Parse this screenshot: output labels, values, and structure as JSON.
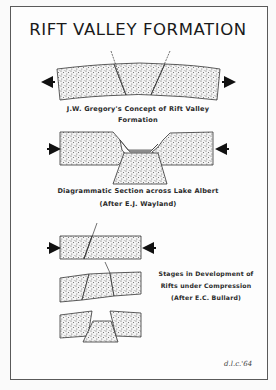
{
  "title": "RIFT VALLEY FORMATION",
  "figures": [
    {
      "id": "gregory",
      "caption_line1": "J.W. Gregory's Concept of Rift Valley",
      "caption_line2": "Formation",
      "forces": "tension"
    },
    {
      "id": "wayland",
      "caption_line1": "Diagrammatic Section across Lake Albert",
      "caption_line2": "(After E.J. Wayland)",
      "forces": "compression"
    },
    {
      "id": "bullard",
      "caption_line1": "Stages in Development of",
      "caption_line2": "Rifts under Compression",
      "caption_line3": "(After E.C. Bullard)",
      "forces": "compression",
      "stages": 3
    }
  ],
  "signature": "d.l.c.'64",
  "colors": {
    "ink": "#1a1a1a",
    "paper": "#fdfdfd",
    "stipple": "#555555"
  }
}
